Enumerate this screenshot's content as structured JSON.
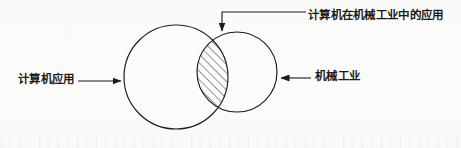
{
  "figure": {
    "type": "venn-diagram",
    "background_color": "#fcfcfb",
    "stroke_color": "#1a1a1a",
    "labels": {
      "left": "计算机应用",
      "right": "机械工业",
      "intersection": "计算机在机械工业中的应用"
    },
    "sets": [
      {
        "name": "计算机应用",
        "position": "left",
        "center_x": 176,
        "center_y": 77,
        "radius": 52,
        "fill": "none"
      },
      {
        "name": "机械工业",
        "position": "right",
        "center_x": 237,
        "center_y": 72,
        "radius": 40,
        "fill": "none"
      }
    ],
    "intersection": {
      "label": "计算机在机械工业中的应用",
      "fill_pattern": "diagonal-hatch",
      "hatch_angle_degrees": 45,
      "hatch_spacing_px": 6
    },
    "annotations": [
      {
        "name": "left-annotation",
        "text": "计算机应用",
        "arrow_direction": "right",
        "arrow_from_x": 78,
        "arrow_to_x": 123,
        "arrow_y": 81
      },
      {
        "name": "right-annotation",
        "text": "机械工业",
        "arrow_direction": "left",
        "arrow_from_x": 311,
        "arrow_to_x": 279,
        "arrow_y": 78
      },
      {
        "name": "intersection-annotation",
        "text": "计算机在机械工业中的应用",
        "arrow_direction": "down",
        "elbow_x": 222,
        "elbow_top_y": 12,
        "arrow_to_y": 33,
        "horizontal_to_x": 306
      }
    ]
  }
}
